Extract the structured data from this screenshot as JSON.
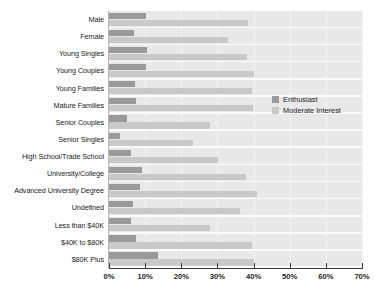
{
  "chart_data": {
    "type": "bar",
    "orientation": "horizontal",
    "title": "",
    "subtitle": "",
    "xlabel": "",
    "ylabel": "",
    "xlim": [
      0,
      70
    ],
    "xtick_labels": [
      "0%",
      "10%",
      "20%",
      "30%",
      "40%",
      "50%",
      "60%",
      "70%"
    ],
    "xticks": [
      0,
      10,
      20,
      30,
      40,
      50,
      60,
      70
    ],
    "grid": true,
    "legend_position": "inside-right-middle",
    "categories": [
      "Male",
      "Female",
      "Young Singles",
      "Young Couples",
      "Young Families",
      "Mature Families",
      "Senior Couples",
      "Senior Singles",
      "High School/Trade School",
      "University/College",
      "Advanced University Degree",
      "Undefined",
      "Less than $40K",
      "$40K to $80K",
      "$80K Plus"
    ],
    "series": [
      {
        "name": "Enthusiast",
        "color": "#9a9a9a",
        "values": [
          10.2,
          7.0,
          10.6,
          10.3,
          7.2,
          7.4,
          5.0,
          3.0,
          6.0,
          9.0,
          8.6,
          6.6,
          6.0,
          7.6,
          13.5
        ]
      },
      {
        "name": "Moderate Interest",
        "color": "#c9c9c9",
        "values": [
          38.5,
          33.0,
          38.3,
          40.0,
          39.5,
          39.8,
          28.0,
          23.3,
          30.2,
          38.0,
          41.0,
          36.2,
          28.0,
          39.6,
          40.0
        ]
      }
    ]
  },
  "legend": {
    "items": [
      {
        "label": "Enthusiast",
        "color": "#9a9a9a"
      },
      {
        "label": "Moderate Interest",
        "color": "#c9c9c9"
      }
    ]
  },
  "colors": {
    "enthusiast": "#9a9a9a",
    "moderate_interest": "#c9c9c9",
    "plot_background": "#e8e8e8",
    "gridline": "#f4f4f4",
    "axis": "#3a3a3a",
    "text": "#1e1e1e"
  }
}
